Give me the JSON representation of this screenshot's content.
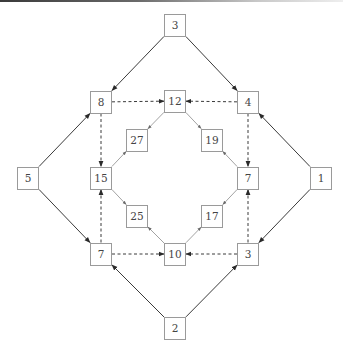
{
  "diagram": {
    "type": "directed-graph",
    "colors": {
      "box_border": "#9a9a9a",
      "text": "#444444",
      "solid_edge": "#3a3a3a",
      "dashed_edge": "#3a3a3a",
      "inner_edge": "#8a8a8a"
    },
    "nodes": [
      {
        "id": "top3",
        "label": "3",
        "x": 175,
        "y": 25
      },
      {
        "id": "n8",
        "label": "8",
        "x": 101,
        "y": 102
      },
      {
        "id": "n12",
        "label": "12",
        "x": 175,
        "y": 101
      },
      {
        "id": "n4",
        "label": "4",
        "x": 248,
        "y": 102
      },
      {
        "id": "n27",
        "label": "27",
        "x": 137,
        "y": 140
      },
      {
        "id": "n19",
        "label": "19",
        "x": 212,
        "y": 140
      },
      {
        "id": "n5",
        "label": "5",
        "x": 28,
        "y": 178
      },
      {
        "id": "n15",
        "label": "15",
        "x": 101,
        "y": 178
      },
      {
        "id": "n7r",
        "label": "7",
        "x": 248,
        "y": 178
      },
      {
        "id": "n1",
        "label": "1",
        "x": 321,
        "y": 178
      },
      {
        "id": "n25",
        "label": "25",
        "x": 137,
        "y": 216
      },
      {
        "id": "n17",
        "label": "17",
        "x": 212,
        "y": 216
      },
      {
        "id": "n7l",
        "label": "7",
        "x": 101,
        "y": 254
      },
      {
        "id": "n10",
        "label": "10",
        "x": 175,
        "y": 254
      },
      {
        "id": "n3r",
        "label": "3",
        "x": 248,
        "y": 254
      },
      {
        "id": "n2",
        "label": "2",
        "x": 175,
        "y": 328
      }
    ],
    "edges": [
      {
        "from": "top3",
        "to": "n8",
        "style": "solid"
      },
      {
        "from": "top3",
        "to": "n4",
        "style": "solid"
      },
      {
        "from": "n5",
        "to": "n8",
        "style": "solid"
      },
      {
        "from": "n5",
        "to": "n7l",
        "style": "solid"
      },
      {
        "from": "n1",
        "to": "n4",
        "style": "solid"
      },
      {
        "from": "n1",
        "to": "n3r",
        "style": "solid"
      },
      {
        "from": "n2",
        "to": "n7l",
        "style": "solid"
      },
      {
        "from": "n2",
        "to": "n3r",
        "style": "solid"
      },
      {
        "from": "n8",
        "to": "n12",
        "style": "dashed"
      },
      {
        "from": "n4",
        "to": "n12",
        "style": "dashed"
      },
      {
        "from": "n8",
        "to": "n15",
        "style": "dashed"
      },
      {
        "from": "n7l",
        "to": "n15",
        "style": "dashed"
      },
      {
        "from": "n4",
        "to": "n7r",
        "style": "dashed"
      },
      {
        "from": "n3r",
        "to": "n7r",
        "style": "dashed"
      },
      {
        "from": "n7l",
        "to": "n10",
        "style": "dashed"
      },
      {
        "from": "n3r",
        "to": "n10",
        "style": "dashed"
      },
      {
        "from": "n12",
        "to": "n27",
        "style": "thin"
      },
      {
        "from": "n15",
        "to": "n27",
        "style": "thin"
      },
      {
        "from": "n12",
        "to": "n19",
        "style": "thin"
      },
      {
        "from": "n7r",
        "to": "n19",
        "style": "thin"
      },
      {
        "from": "n15",
        "to": "n25",
        "style": "thin"
      },
      {
        "from": "n10",
        "to": "n25",
        "style": "thin"
      },
      {
        "from": "n7r",
        "to": "n17",
        "style": "thin"
      },
      {
        "from": "n10",
        "to": "n17",
        "style": "thin"
      }
    ]
  }
}
